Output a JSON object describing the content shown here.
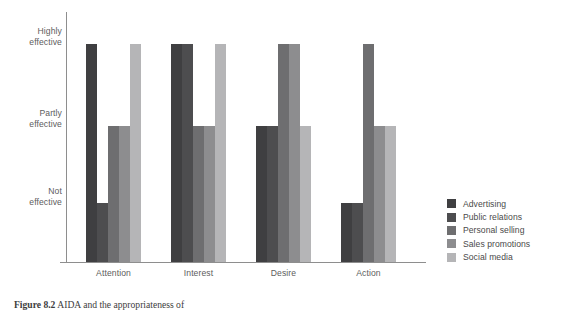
{
  "caption": {
    "number": "Figure 8.2",
    "text": "AIDA and the appropriateness of"
  },
  "legend": {
    "position": "right",
    "items": [
      {
        "label": "Advertising",
        "color": "#3f3f41"
      },
      {
        "label": "Public relations",
        "color": "#4d4d4f"
      },
      {
        "label": "Personal selling",
        "color": "#6e6e70"
      },
      {
        "label": "Sales promotions",
        "color": "#8d8d8f"
      },
      {
        "label": "Social media",
        "color": "#b5b5b7"
      }
    ]
  },
  "axes": {
    "y_ticks": [
      {
        "line1": "Highly",
        "line2": "effective"
      },
      {
        "line1": "Partly",
        "line2": "effective"
      },
      {
        "line1": "Not",
        "line2": "effective"
      }
    ],
    "x_ticks": [
      "Attention",
      "Interest",
      "Desire",
      "Action"
    ]
  },
  "chart_data": {
    "type": "bar",
    "title": "",
    "subtitle": "",
    "xlabel": "",
    "ylabel": "",
    "grid": false,
    "legend_position": "right",
    "categories": [
      "Attention",
      "Interest",
      "Desire",
      "Action"
    ],
    "y_scale": "ordinal",
    "y_levels": [
      "Not effective",
      "Partly effective",
      "Highly effective"
    ],
    "ylim": [
      0,
      3
    ],
    "y_tick_labels": [
      "Highly effective",
      "Partly effective",
      "Not effective"
    ],
    "series": [
      {
        "name": "Advertising",
        "color": "#3f3f41",
        "values": [
          3,
          3,
          2,
          1
        ],
        "value_labels": [
          "Highly effective",
          "Highly effective",
          "Partly effective",
          "Not effective"
        ]
      },
      {
        "name": "Public relations",
        "color": "#4d4d4f",
        "values": [
          1,
          3,
          2,
          1
        ],
        "value_labels": [
          "Not effective",
          "Highly effective",
          "Partly effective",
          "Not effective"
        ]
      },
      {
        "name": "Personal selling",
        "color": "#6e6e70",
        "values": [
          2,
          2,
          3,
          3
        ],
        "value_labels": [
          "Partly effective",
          "Partly effective",
          "Highly effective",
          "Highly effective"
        ]
      },
      {
        "name": "Sales promotions",
        "color": "#8d8d8f",
        "values": [
          2,
          2,
          3,
          2
        ],
        "value_labels": [
          "Partly effective",
          "Partly effective",
          "Highly effective",
          "Partly effective"
        ]
      },
      {
        "name": "Social media",
        "color": "#b5b5b7",
        "values": [
          3,
          3,
          2,
          2
        ],
        "value_labels": [
          "Highly effective",
          "Highly effective",
          "Partly effective",
          "Partly effective"
        ]
      }
    ]
  }
}
